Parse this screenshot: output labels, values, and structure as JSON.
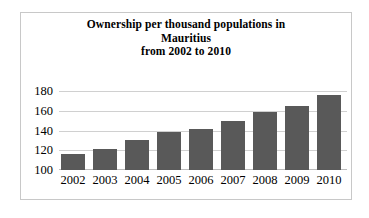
{
  "chart_data": {
    "type": "bar",
    "title": "Ownership per thousand populations in Mauritius from 2002 to 2010",
    "title_lines": [
      "Ownership per thousand populations in",
      "Mauritius",
      "from 2002 to 2010"
    ],
    "categories": [
      "2002",
      "2003",
      "2004",
      "2005",
      "2006",
      "2007",
      "2008",
      "2009",
      "2010"
    ],
    "values": [
      116,
      121,
      130,
      138,
      142,
      150,
      159,
      165,
      176
    ],
    "xlabel": "",
    "ylabel": "",
    "ylim": [
      100,
      180
    ],
    "yticks": [
      100,
      120,
      140,
      160,
      180
    ],
    "ytick_labels": [
      "100",
      "120",
      "140",
      "160",
      "180"
    ],
    "grid": true,
    "legend": false,
    "legend_position": "none",
    "series": [
      {
        "name": "Ownership per thousand populations",
        "values": [
          116,
          121,
          130,
          138,
          142,
          150,
          159,
          165,
          176
        ],
        "color": "#595959"
      }
    ],
    "colors": {
      "bar": "#595959",
      "gridline": "#d0d0d0",
      "axis": "#bdbdbd",
      "frame_border": "#c8c8c8",
      "background": "#ffffff",
      "text": "#000000"
    }
  }
}
